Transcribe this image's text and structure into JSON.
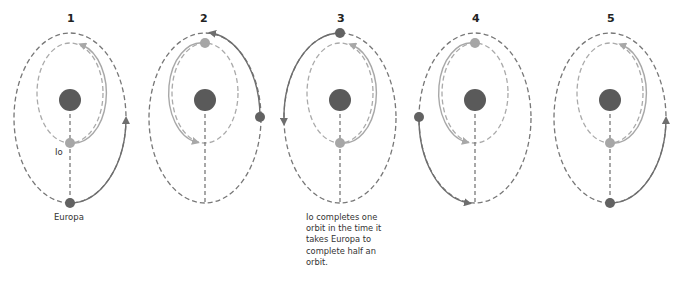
{
  "diagram": {
    "panels": [
      {
        "number": "1",
        "io_position": "bottom",
        "europa_position": "bottom"
      },
      {
        "number": "2",
        "io_position": "top",
        "europa_position": "right"
      },
      {
        "number": "3",
        "io_position": "bottom",
        "europa_position": "top"
      },
      {
        "number": "4",
        "io_position": "top",
        "europa_position": "left"
      },
      {
        "number": "5",
        "io_position": "bottom",
        "europa_position": "bottom"
      }
    ],
    "labels": {
      "io": "Io",
      "europa": "Europa"
    },
    "caption": "Io completes one orbit in the time it takes Europa to complete half an orbit.",
    "colors": {
      "jupiter": "#5a5a5a",
      "europa": "#626262",
      "io": "#a6a6a6",
      "europa_orbit": "#6e6e6e",
      "io_orbit": "#a8a8a8"
    }
  }
}
